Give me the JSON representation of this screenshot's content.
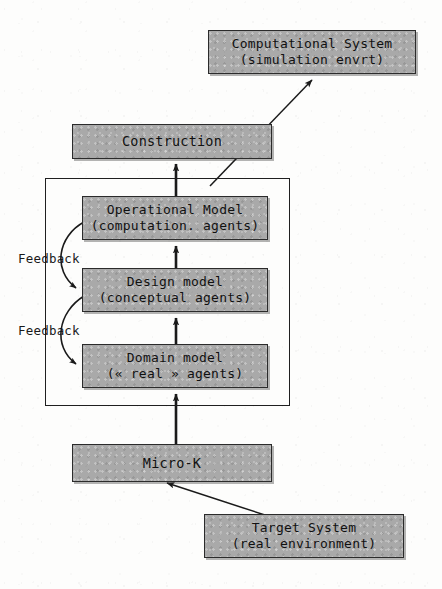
{
  "diagram": {
    "nodes": [
      {
        "id": "computational-system",
        "line1": "Computational System",
        "line2": "(simulation envrt)",
        "x": 208,
        "y": 30,
        "w": 208,
        "h": 44
      },
      {
        "id": "construction",
        "line1": "Construction",
        "line2": "",
        "x": 72,
        "y": 124,
        "w": 200,
        "h": 35
      },
      {
        "id": "operational-model",
        "line1": "Operational Model",
        "line2": "(computation. agents)",
        "x": 82,
        "y": 196,
        "w": 186,
        "h": 44
      },
      {
        "id": "design-model",
        "line1": "Design model",
        "line2": "(conceptual agents)",
        "x": 82,
        "y": 268,
        "w": 186,
        "h": 44
      },
      {
        "id": "domain-model",
        "line1": "Domain model",
        "line2": "(« real » agents)",
        "x": 82,
        "y": 344,
        "w": 186,
        "h": 44
      },
      {
        "id": "micro-k",
        "line1": "Micro-K",
        "line2": "",
        "x": 72,
        "y": 444,
        "w": 200,
        "h": 38
      },
      {
        "id": "target-system",
        "line1": "Target System",
        "line2": "(real environment)",
        "x": 204,
        "y": 514,
        "w": 200,
        "h": 44
      }
    ],
    "group_frame": {
      "x": 45,
      "y": 178,
      "w": 245,
      "h": 228
    },
    "feedback_labels": [
      {
        "id": "feedback-upper",
        "text": "Feedback",
        "x": 18,
        "y": 251
      },
      {
        "id": "feedback-lower",
        "text": "Feedback",
        "x": 18,
        "y": 323
      }
    ],
    "colors": {
      "node_fill": "#a9a9a9",
      "node_stroke": "#2b2b2b",
      "arrow": "#1a1a1a",
      "background": "#fdfdfc"
    },
    "connections": [
      {
        "from": "construction",
        "to": "computational-system",
        "kind": "diagonal-arrow"
      },
      {
        "from": "operational-model",
        "to": "construction",
        "kind": "vertical-arrow"
      },
      {
        "from": "design-model",
        "to": "operational-model",
        "kind": "vertical-arrow"
      },
      {
        "from": "domain-model",
        "to": "design-model",
        "kind": "vertical-arrow"
      },
      {
        "from": "micro-k",
        "to": "domain-model",
        "kind": "vertical-arrow"
      },
      {
        "from": "target-system",
        "to": "micro-k",
        "kind": "diagonal-arrow"
      },
      {
        "from": "operational-model",
        "to": "design-model",
        "kind": "feedback-curve"
      },
      {
        "from": "design-model",
        "to": "domain-model",
        "kind": "feedback-curve"
      }
    ]
  }
}
